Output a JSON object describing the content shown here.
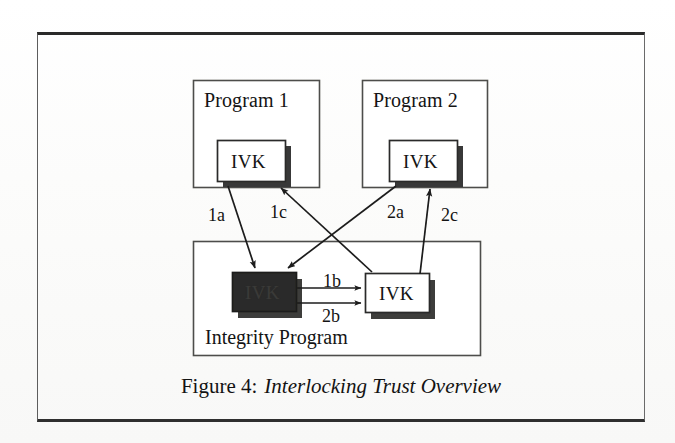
{
  "figure": {
    "caption_number": "Figure 4:",
    "caption_title": "Interlocking Trust Overview",
    "colors": {
      "ink": "#141414",
      "frame": "#2a2a2a",
      "box_stroke": "#4a4a48",
      "shadow": "#3b3b39",
      "fill_white": "#ffffff",
      "fill_dark": "#2e2e2c",
      "paper": "#fdfdfd"
    }
  },
  "nodes": {
    "program1": {
      "label": "Program 1",
      "ivk_label": "IVK",
      "ivk_style": "white"
    },
    "program2": {
      "label": "Program 2",
      "ivk_label": "IVK",
      "ivk_style": "white"
    },
    "integrity": {
      "label": "Integrity Program",
      "ivk_dark_label": "IVK",
      "ivk_dark_style": "dark-filled",
      "ivk_light_label": "IVK",
      "ivk_light_style": "white"
    }
  },
  "edges": [
    {
      "id": "1a",
      "label": "1a",
      "from": "program1.ivk",
      "to": "integrity.ivk_dark"
    },
    {
      "id": "1b",
      "label": "1b",
      "from": "integrity.ivk_dark",
      "to": "integrity.ivk_light"
    },
    {
      "id": "1c",
      "label": "1c",
      "from": "integrity.ivk_light",
      "to": "program1.ivk"
    },
    {
      "id": "2a",
      "label": "2a",
      "from": "program2.ivk",
      "to": "integrity.ivk_dark"
    },
    {
      "id": "2b",
      "label": "2b",
      "from": "integrity.ivk_dark",
      "to": "integrity.ivk_light"
    },
    {
      "id": "2c",
      "label": "2c",
      "from": "integrity.ivk_light",
      "to": "program2.ivk"
    }
  ]
}
